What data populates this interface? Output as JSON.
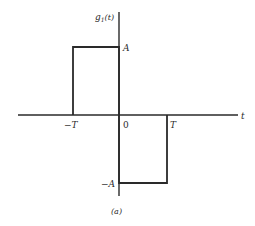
{
  "diagram": {
    "type": "signal-waveform",
    "y_axis_label": "g",
    "y_axis_subscript": "1",
    "y_axis_arg": "(t)",
    "x_axis_label": "t",
    "tick_labels": {
      "neg_T": "−T",
      "zero": "0",
      "pos_T": "T",
      "pos_A": "A",
      "neg_A": "−A"
    },
    "caption": "(a)",
    "stroke_color": "#2a2a2a",
    "segments": [
      {
        "from": "-T",
        "to": "0",
        "level": "A"
      },
      {
        "from": "0",
        "to": "T",
        "level": "-A"
      }
    ]
  }
}
